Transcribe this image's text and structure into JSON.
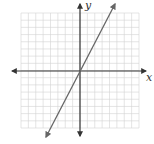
{
  "graph": {
    "type": "coordinate-plane-line",
    "x_axis_label": "x",
    "y_axis_label": "y",
    "grid": {
      "cells_x": 16,
      "cells_y": 16,
      "color": "#d0d0d0"
    },
    "axis_color": "#333333",
    "line_color": "#666666"
  },
  "chart_data": {
    "type": "line",
    "title": "",
    "xlabel": "x",
    "ylabel": "y",
    "grid": true,
    "xlim": [
      -8,
      8
    ],
    "ylim": [
      -8,
      8
    ],
    "series": [
      {
        "name": "y = 2x",
        "x": [
          -4,
          0,
          4
        ],
        "values": [
          -8,
          0,
          8
        ]
      }
    ]
  }
}
